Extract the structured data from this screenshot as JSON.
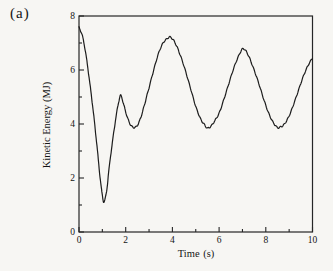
{
  "chart_data": {
    "type": "line",
    "panel_label": "(a)",
    "title": "",
    "xlabel": "Time (s)",
    "ylabel": "Kinetic Energy (MJ)",
    "xlim": [
      0,
      10
    ],
    "ylim": [
      0,
      8
    ],
    "x_major_ticks": [
      0,
      2,
      4,
      6,
      8,
      10
    ],
    "x_minor_ticks": [
      1,
      3,
      5,
      7,
      9
    ],
    "y_major_ticks": [
      0,
      2,
      4,
      6,
      8
    ],
    "y_minor_ticks": [
      1,
      3,
      5,
      7
    ],
    "grid": false,
    "legend": "none",
    "frame": "full-box",
    "tick_direction": "in",
    "style": {
      "line_color": "#1c1c1c",
      "frame_color": "#262626",
      "text_color": "#151515",
      "background": "#f7f6f3"
    },
    "series": [
      {
        "name": "kinetic-energy",
        "x": [
          0,
          0.15,
          0.3,
          0.45,
          0.6,
          0.75,
          0.9,
          1.0,
          1.07,
          1.18,
          1.3,
          1.45,
          1.6,
          1.72,
          1.8,
          1.92,
          2.05,
          2.2,
          2.35,
          2.5,
          2.65,
          2.8,
          3.0,
          3.2,
          3.4,
          3.6,
          3.8,
          3.9,
          4.05,
          4.2,
          4.4,
          4.6,
          4.8,
          5.0,
          5.2,
          5.35,
          5.5,
          5.65,
          5.8,
          6.0,
          6.2,
          6.4,
          6.6,
          6.8,
          7.0,
          7.15,
          7.3,
          7.5,
          7.7,
          7.9,
          8.1,
          8.3,
          8.5,
          8.65,
          8.8,
          9.0,
          9.2,
          9.4,
          9.6,
          9.8,
          10.0
        ],
        "y": [
          7.58,
          7.25,
          6.55,
          5.6,
          4.55,
          3.35,
          2.05,
          1.35,
          1.12,
          1.5,
          2.45,
          3.45,
          4.35,
          4.9,
          5.05,
          4.7,
          4.3,
          3.98,
          3.87,
          3.95,
          4.25,
          4.7,
          5.35,
          6.0,
          6.6,
          7.0,
          7.18,
          7.22,
          7.1,
          6.85,
          6.4,
          5.85,
          5.25,
          4.65,
          4.2,
          4.0,
          3.85,
          3.92,
          4.1,
          4.4,
          4.9,
          5.45,
          6.0,
          6.45,
          6.78,
          6.7,
          6.45,
          6.0,
          5.5,
          4.95,
          4.45,
          4.08,
          3.87,
          3.9,
          4.0,
          4.3,
          4.75,
          5.25,
          5.75,
          6.15,
          6.45
        ]
      }
    ]
  }
}
